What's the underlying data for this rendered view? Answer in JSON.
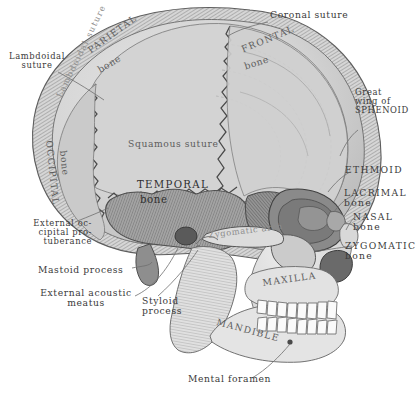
{
  "figure": {
    "background_color": "#ffffff",
    "ink_color": "#3a3a3a",
    "tones": {
      "cranium_light": "#d8d8d8",
      "parietal": "#d2d2d2",
      "frontal": "#cfcfcf",
      "occipital": "#cccccc",
      "temporal": "#9a9a9a",
      "sphenoid": "#8f8f8f",
      "face_light": "#e6e6e6",
      "teeth": "#fbfbfb",
      "orbit_shadow": "#7d7d7d"
    }
  },
  "labels": {
    "coronal_suture": "Coronal suture",
    "lambdoidal_suture": "Lambdoidal\nsuture",
    "lambdoidal_suture_on_bone": "Lambdoidal suture",
    "parietal_bone_line1": "PARIETAL",
    "parietal_bone_line2": "bone",
    "frontal_bone_line1": "FRONTAL",
    "frontal_bone_line2": "bone",
    "occipital_bone_line1": "OCCIPITAL",
    "occipital_bone_line2": "bone",
    "squamous_suture": "Squamous suture",
    "temporal_bone_line1": "TEMPORAL",
    "temporal_bone_line2": "bone",
    "great_wing_of_sphenoid": "Great\nwing of\nSPHENOID",
    "ethmoid": "ETHMOID",
    "lacrimal_bone": "LACRIMAL\nbone",
    "nasal_bone": "NASAL\nbone",
    "zygomatic_bone": "ZYGOMATIC\nbone",
    "zygomatic_arch": "Zygomatic arch",
    "external_occipital_protuberance": "External oc-\ncipital pro-\ntuberance",
    "mastoid_process": "Mastoid process",
    "external_acoustic_meatus": "External acoustic\nmeatus",
    "styloid_process": "Styloid\nprocess",
    "maxilla": "MAXILLA",
    "mandible": "MANDIBLE",
    "mental_foramen": "Mental foramen"
  }
}
